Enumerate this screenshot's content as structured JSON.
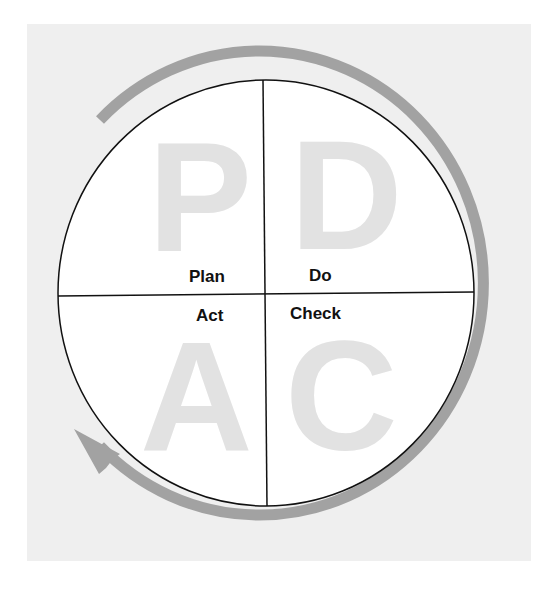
{
  "diagram": {
    "type": "cycle",
    "background_color": "#efefef",
    "arrow_color": "#a2a2a2",
    "letter_color": "#e2e2e2",
    "outline_color": "#111111",
    "quadrants": [
      {
        "position": "top-left",
        "letter": "P",
        "label": "Plan"
      },
      {
        "position": "top-right",
        "letter": "D",
        "label": "Do"
      },
      {
        "position": "bottom-right",
        "letter": "C",
        "label": "Check"
      },
      {
        "position": "bottom-left",
        "letter": "A",
        "label": "Act"
      }
    ],
    "arrow_direction": "clockwise"
  }
}
